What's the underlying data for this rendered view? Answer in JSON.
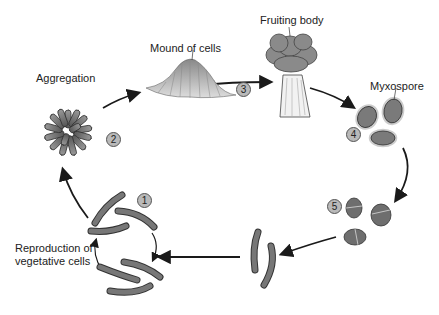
{
  "stages": [
    {
      "number": "1",
      "label": "Reproduction of vegetative cells",
      "label_lines": [
        "Reproduction of",
        "vegetative cells"
      ]
    },
    {
      "number": "2",
      "label": "Aggregation"
    },
    {
      "number": "3",
      "label": "Mound of cells"
    },
    {
      "number": "4",
      "label": "Fruiting body"
    },
    {
      "number": "5",
      "label": "Myxospore"
    }
  ],
  "labels": {
    "aggregation": "Aggregation",
    "mound": "Mound of cells",
    "fruiting": "Fruiting body",
    "myxospore": "Myxospore",
    "repro_line1": "Reproduction of",
    "repro_line2": "vegetative cells"
  },
  "badges": {
    "b1": "1",
    "b2": "2",
    "b3": "3",
    "b4": "4",
    "b5": "5"
  },
  "colors": {
    "cell_fill": "#6e6e6e",
    "cell_outline": "#3a3a3a",
    "badge_fill": "#b9b9b9",
    "arrow": "#1a1a1a"
  }
}
